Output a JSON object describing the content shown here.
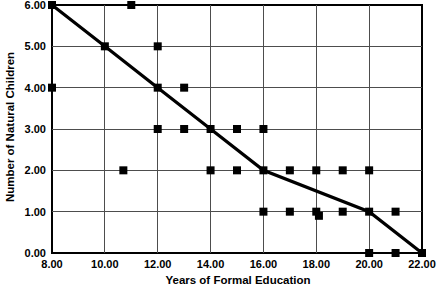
{
  "chart_data": {
    "type": "scatter",
    "title": "",
    "xlabel": "Years of Formal Education",
    "ylabel": "Number of Natural Children",
    "xlim": [
      8,
      22
    ],
    "ylim": [
      0,
      6
    ],
    "xticks": [
      8,
      10,
      12,
      14,
      16,
      18,
      20,
      22
    ],
    "yticks": [
      0,
      1,
      2,
      3,
      4,
      5,
      6
    ],
    "xtick_labels": [
      "8.00",
      "10.00",
      "12.00",
      "14.00",
      "16.00",
      "18.00",
      "20.00",
      "22.00"
    ],
    "ytick_labels": [
      "0.00",
      "1.00",
      "2.00",
      "3.00",
      "4.00",
      "5.00",
      "6.00"
    ],
    "grid": true,
    "legend": "none",
    "series": [
      {
        "name": "observations",
        "marker": "square",
        "color": "#000000",
        "points": [
          [
            8,
            6
          ],
          [
            11,
            6
          ],
          [
            10,
            5
          ],
          [
            12,
            5
          ],
          [
            8,
            4
          ],
          [
            12,
            4
          ],
          [
            13,
            4
          ],
          [
            12,
            3
          ],
          [
            13,
            3
          ],
          [
            14,
            3
          ],
          [
            15,
            3
          ],
          [
            16,
            3
          ],
          [
            10.7,
            2
          ],
          [
            14,
            2
          ],
          [
            15,
            2
          ],
          [
            16,
            2
          ],
          [
            17,
            2
          ],
          [
            18,
            2
          ],
          [
            19,
            2
          ],
          [
            20,
            2
          ],
          [
            16,
            1
          ],
          [
            17,
            1
          ],
          [
            18,
            1
          ],
          [
            18.1,
            0.9
          ],
          [
            19,
            1
          ],
          [
            20,
            1
          ],
          [
            21,
            1
          ],
          [
            20,
            0
          ],
          [
            21,
            0
          ],
          [
            22,
            0
          ]
        ]
      },
      {
        "name": "trend-line",
        "marker": "none",
        "color": "#000000",
        "points": [
          [
            8,
            6
          ],
          [
            10,
            5
          ],
          [
            12,
            4
          ],
          [
            14,
            3
          ],
          [
            16,
            2
          ],
          [
            20,
            1
          ],
          [
            22,
            0
          ]
        ]
      }
    ]
  },
  "axis": {
    "x_title": "Years of Formal Education",
    "y_title": "Number of Natural Children"
  }
}
